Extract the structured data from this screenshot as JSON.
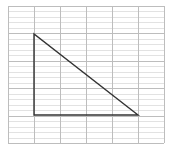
{
  "diagram": {
    "type": "triangle-on-grid",
    "grid": {
      "left": 8,
      "top": 6,
      "right": 164,
      "bottom": 143,
      "columns": 6,
      "rows": 5,
      "minor_per_row": 5,
      "major_color": "#bdbdbd",
      "minor_color": "#e2e2e2"
    },
    "triangle": {
      "vertices": [
        [
          34,
          34
        ],
        [
          34,
          115
        ],
        [
          138,
          115
        ]
      ],
      "grid_vertices": [
        [
          1,
          1
        ],
        [
          1,
          4
        ],
        [
          5,
          4
        ]
      ],
      "stroke": "#333333",
      "stroke_width": 1.4
    }
  }
}
